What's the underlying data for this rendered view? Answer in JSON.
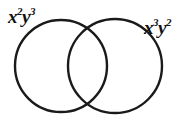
{
  "diagram": {
    "type": "venn",
    "stroke_color": "#1a1a1a",
    "background": "#ffffff",
    "sets": [
      {
        "label_base1": "x",
        "label_exp1": "2",
        "label_base2": "y",
        "label_exp2": "3",
        "cx": 61,
        "cy": 66,
        "r": 46
      },
      {
        "label_base1": "x",
        "label_exp1": "3",
        "label_base2": "y",
        "label_exp2": "2",
        "cx": 115,
        "cy": 66,
        "r": 47
      }
    ]
  }
}
